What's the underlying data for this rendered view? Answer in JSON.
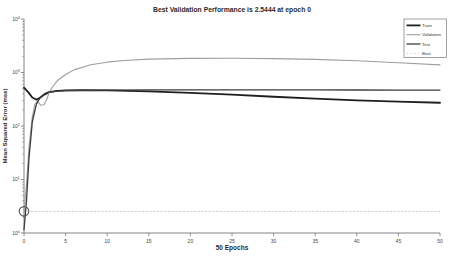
{
  "window": {
    "background": "#ffffff"
  },
  "colors": {
    "axis": "#666666",
    "tick_label": "#444444",
    "title_text": "#2b2b2b",
    "axis_label_text": "#2b2b2b",
    "legend_border": "#777777",
    "legend_text": "#333333",
    "best_marker": "#565656"
  },
  "chart_data": {
    "type": "line",
    "title": "Best Validation Performance is 2.5444 at epoch 0",
    "xlabel": "50 Epochs",
    "ylabel": "Mean Squared Error  (mse)",
    "x_axis_label_meaning": "training epoch",
    "xlim": [
      0,
      50
    ],
    "x_ticks": [
      0,
      5,
      10,
      15,
      20,
      25,
      30,
      35,
      40,
      45,
      50
    ],
    "y_scale": "log10",
    "ylim_log10": [
      0,
      4
    ],
    "y_ticks_log10": [
      0,
      1,
      2,
      3,
      4
    ],
    "grid": "off",
    "legend_position": "top-right",
    "best": {
      "epoch": 0,
      "value": 2.5444
    },
    "series": [
      {
        "name": "Train",
        "color": "#1f1f1f",
        "width": 1.8,
        "dash": "",
        "x": [
          0,
          0.5,
          1,
          1.5,
          2,
          2.5,
          3,
          4,
          5,
          7,
          10,
          15,
          20,
          25,
          30,
          35,
          40,
          45,
          50
        ],
        "y": [
          520,
          430,
          340,
          310,
          345,
          390,
          430,
          455,
          465,
          470,
          465,
          445,
          415,
          385,
          352,
          325,
          302,
          286,
          272
        ]
      },
      {
        "name": "Validation",
        "color": "#9e9e9e",
        "width": 1.1,
        "dash": "",
        "x": [
          0,
          0.3,
          0.6,
          1,
          1.3,
          1.6,
          2,
          2.4,
          2.8,
          3,
          3.5,
          4,
          5,
          6,
          8,
          10,
          12,
          15,
          20,
          25,
          30,
          35,
          40,
          45,
          50
        ],
        "y": [
          2.5444,
          8,
          40,
          150,
          255,
          290,
          245,
          250,
          330,
          420,
          560,
          700,
          920,
          1120,
          1400,
          1560,
          1680,
          1780,
          1840,
          1845,
          1820,
          1760,
          1660,
          1520,
          1390
        ]
      },
      {
        "name": "Test",
        "color": "#3d3d3d",
        "width": 1.3,
        "dash": "",
        "x": [
          0,
          0.3,
          0.6,
          1,
          1.5,
          2,
          2.5,
          3,
          4,
          5,
          7,
          10,
          15,
          20,
          25,
          30,
          35,
          40,
          45,
          50
        ],
        "y": [
          1.15,
          4,
          25,
          120,
          260,
          350,
          405,
          430,
          450,
          458,
          465,
          468,
          472,
          474,
          474,
          473,
          472,
          471,
          470,
          469
        ]
      },
      {
        "name": "Best",
        "color": "#c9cfc9",
        "width": 1,
        "dash": "1.5 2.2",
        "x": [
          0,
          50
        ],
        "y": [
          2.5444,
          2.5444
        ]
      }
    ]
  }
}
